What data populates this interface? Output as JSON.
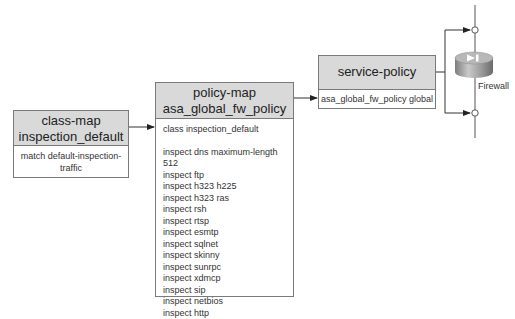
{
  "class_map": {
    "title_line1": "class-map",
    "title_line2": "inspection_default",
    "body": "match default-inspection-traffic"
  },
  "policy_map": {
    "title_line1": "policy-map",
    "title_line2": "asa_global_fw_policy",
    "class_line": "class inspection_default",
    "inspects": [
      "inspect dns maximum-length 512",
      "inspect ftp",
      "inspect h323 h225",
      "inspect h323 ras",
      "inspect rsh",
      "inspect rtsp",
      "inspect esmtp",
      "inspect sqlnet",
      "inspect skinny",
      "inspect sunrpc",
      "inspect xdmcp",
      "inspect sip",
      "inspect netbios",
      "inspect http"
    ]
  },
  "service_policy": {
    "title": "service-policy",
    "body": "asa_global_fw_policy global"
  },
  "firewall": {
    "label": "Firewall",
    "icon": "firewall-icon"
  },
  "colors": {
    "header_fill": "#d9d9d9",
    "border": "#7a7a7a",
    "line": "#333333"
  }
}
